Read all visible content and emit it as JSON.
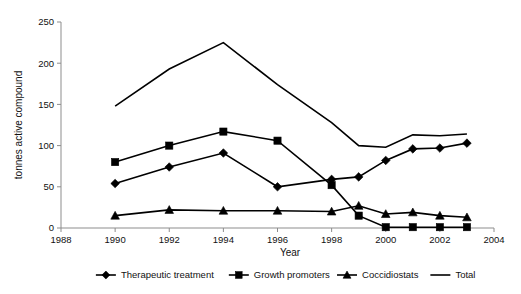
{
  "chart_data": {
    "type": "line",
    "title": "",
    "xlabel": "Year",
    "ylabel": "tonnes active compound",
    "xlim": [
      1988,
      2004
    ],
    "ylim": [
      0,
      250
    ],
    "grid": false,
    "legend_position": "bottom",
    "x": [
      1990,
      1992,
      1994,
      1996,
      1998,
      1999,
      2000,
      2001,
      2002,
      2003
    ],
    "xtick_labels": [
      "1988",
      "1990",
      "1992",
      "1994",
      "1996",
      "1998",
      "2000",
      "2002",
      "2004"
    ],
    "xtick_values": [
      1988,
      1990,
      1992,
      1994,
      1996,
      1998,
      2000,
      2002,
      2004
    ],
    "ytick_labels": [
      "0",
      "50",
      "100",
      "150",
      "200",
      "250"
    ],
    "ytick_values": [
      0,
      50,
      100,
      150,
      200,
      250
    ],
    "series": [
      {
        "name": "Therapeutic treatment",
        "marker": "diamond",
        "color": "#000000",
        "values": [
          54,
          74,
          91,
          50,
          59,
          62,
          82,
          96,
          97,
          103
        ]
      },
      {
        "name": "Growth promoters",
        "marker": "square",
        "color": "#000000",
        "values": [
          80,
          100,
          117,
          106,
          52,
          15,
          1,
          1,
          1,
          1
        ]
      },
      {
        "name": "Coccidiostats",
        "marker": "triangle",
        "color": "#000000",
        "values": [
          15,
          22,
          21,
          21,
          20,
          27,
          17,
          19,
          15,
          13
        ]
      },
      {
        "name": "Total",
        "marker": "none",
        "color": "#000000",
        "values": [
          148,
          193,
          225,
          174,
          128,
          100,
          98,
          113,
          112,
          114
        ]
      }
    ]
  },
  "legend": {
    "entries": [
      {
        "label": "Therapeutic treatment",
        "marker": "diamond"
      },
      {
        "label": "Growth promoters",
        "marker": "square"
      },
      {
        "label": "Coccidiostats",
        "marker": "triangle"
      },
      {
        "label": "Total",
        "marker": "none"
      }
    ]
  }
}
